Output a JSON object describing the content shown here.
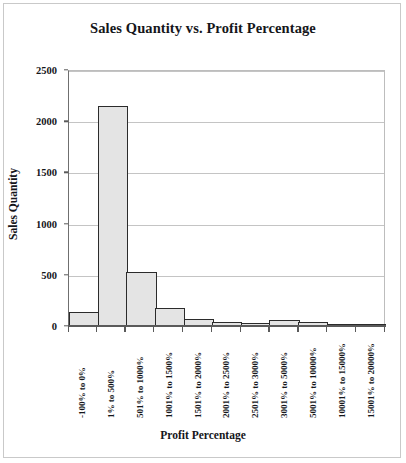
{
  "chart_data": {
    "type": "bar",
    "title": "Sales Quantity vs. Profit Percentage",
    "xlabel": "Profit Percentage",
    "ylabel": "Sales Quantity",
    "categories": [
      "-100% to 0%",
      "1% to 500%",
      "501% to 1000%",
      "1001% to 1500%",
      "1501% to 2000%",
      "2001% to 2500%",
      "2501% to 3000%",
      "3001% to 5000%",
      "5001% to 10000%",
      "10001% to 15000%",
      "15001% to 20000%"
    ],
    "values": [
      140,
      2150,
      530,
      175,
      70,
      35,
      30,
      55,
      35,
      5,
      3
    ],
    "ylim": [
      0,
      2500
    ],
    "yticks": [
      0,
      500,
      1000,
      1500,
      2000,
      2500
    ],
    "ytick_labels": [
      "0",
      "500",
      "1000",
      "1500",
      "2000",
      "2500"
    ],
    "grid": true,
    "legend": false,
    "bar_fill_color": "#e4e4e4",
    "bar_border_color": "#2b2b2b",
    "gridline_color": "#c4c4c4",
    "axis_color": "#5a5a5a",
    "background_color": "#ffffff",
    "text_color": "#15161a"
  }
}
